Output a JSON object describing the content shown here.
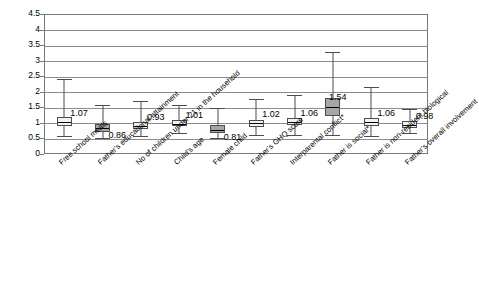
{
  "chart_data": {
    "type": "bar",
    "subtype": "box-and-whisker",
    "title": "",
    "xlabel": "",
    "ylabel": "",
    "ylim": [
      0,
      4.5
    ],
    "yticks": [
      "0",
      "0.5",
      "1",
      "1.5",
      "2",
      "2.5",
      "3",
      "3.5",
      "4",
      "4.5"
    ],
    "grid": true,
    "legend": "none",
    "categories": [
      "Free school meals",
      "Father's educational attainment",
      "No of children under 21 in the household",
      "Child's age",
      "Female child",
      "Father's GHQ score",
      "Interparental conflict*",
      "Father is social*",
      "Father is non-resident biological",
      "Father's overall involvement"
    ],
    "values": [
      1.07,
      0.86,
      0.93,
      1.01,
      0.81,
      1.02,
      1.06,
      1.54,
      1.06,
      0.98
    ],
    "value_labels": [
      "1.07",
      "0.86",
      "0.93",
      "1.01",
      "0.81",
      "1.02",
      "1.06",
      "1.54",
      "1.06",
      "0.98"
    ],
    "series": [
      {
        "name": "Odds ratio with confidence interval",
        "points": [
          {
            "category": "Free school meals",
            "low": 0.62,
            "q1": 0.93,
            "median": 1.07,
            "q3": 1.22,
            "high": 2.45,
            "label": "1.07"
          },
          {
            "category": "Father's educational attainment",
            "low": 0.56,
            "q1": 0.75,
            "median": 0.86,
            "q3": 1.0,
            "high": 1.6,
            "label": "0.86"
          },
          {
            "category": "No of children under 21 in the household",
            "low": 0.62,
            "q1": 0.84,
            "median": 0.93,
            "q3": 1.05,
            "high": 1.72,
            "label": "0.93"
          },
          {
            "category": "Child's age",
            "low": 0.7,
            "q1": 0.92,
            "median": 1.01,
            "q3": 1.12,
            "high": 1.62,
            "label": "1.01"
          },
          {
            "category": "Female child",
            "low": 0.54,
            "q1": 0.7,
            "median": 0.81,
            "q3": 0.95,
            "high": 1.52,
            "label": "0.81"
          },
          {
            "category": "Father's GHQ score",
            "low": 0.63,
            "q1": 0.91,
            "median": 1.02,
            "q3": 1.14,
            "high": 1.8,
            "label": "1.02"
          },
          {
            "category": "Interparental conflict*",
            "low": 0.64,
            "q1": 0.95,
            "median": 1.06,
            "q3": 1.18,
            "high": 1.94,
            "label": "1.06"
          },
          {
            "category": "Father is social*",
            "low": 0.64,
            "q1": 1.25,
            "median": 1.54,
            "q3": 1.84,
            "high": 3.3,
            "label": "1.54"
          },
          {
            "category": "Father is non-resident biological",
            "low": 0.62,
            "q1": 0.94,
            "median": 1.06,
            "q3": 1.2,
            "high": 2.2,
            "label": "1.06"
          },
          {
            "category": "Father's overall involvement",
            "low": 0.7,
            "q1": 0.88,
            "median": 0.98,
            "q3": 1.08,
            "high": 1.48,
            "label": "0.98"
          }
        ]
      }
    ],
    "colors": {
      "box_fill_light": "#f2f2f2",
      "box_fill_dark": "#a6a6a6",
      "line": "#4d4d4d",
      "grid": "#8c8c8c",
      "frame": "#7a7a7a",
      "text": "#000000"
    },
    "box_fill_index_dark": [
      1,
      4,
      7
    ]
  }
}
